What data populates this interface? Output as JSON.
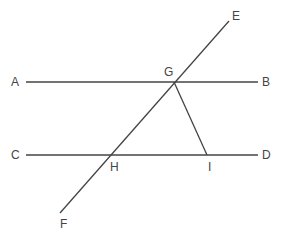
{
  "diagram": {
    "type": "geometry",
    "colors": {
      "stroke": "#444444",
      "label": "#444444",
      "background": "#ffffff"
    },
    "points": {
      "A": {
        "label": "A",
        "x": 15,
        "y": 86
      },
      "B": {
        "label": "B",
        "x": 266,
        "y": 86
      },
      "C": {
        "label": "C",
        "x": 15,
        "y": 159
      },
      "D": {
        "label": "D",
        "x": 266,
        "y": 159
      },
      "E": {
        "label": "E",
        "x": 236,
        "y": 20
      },
      "F": {
        "label": "F",
        "x": 63,
        "y": 228
      },
      "G": {
        "label": "G",
        "x": 168,
        "y": 76
      },
      "H": {
        "label": "H",
        "x": 111,
        "y": 171
      },
      "I": {
        "label": "I",
        "x": 208,
        "y": 171
      }
    },
    "lines": [
      {
        "name": "AB",
        "x1": 26,
        "y1": 82,
        "x2": 258,
        "y2": 82
      },
      {
        "name": "CD",
        "x1": 26,
        "y1": 155,
        "x2": 258,
        "y2": 155
      },
      {
        "name": "EF",
        "x1": 229,
        "y1": 21,
        "x2": 60,
        "y2": 213
      },
      {
        "name": "GI",
        "x1": 174,
        "y1": 82,
        "x2": 207,
        "y2": 155
      }
    ]
  }
}
